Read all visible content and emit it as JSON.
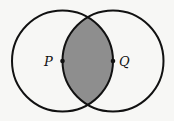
{
  "diagram": {
    "type": "two-circle intersection (vesica piscis)",
    "background_color": "#f7f7f5",
    "stroke_color": "#111111",
    "shaded_region_color": "#8e8e8e",
    "circles": [
      {
        "name": "left-circle",
        "cx": 62.5,
        "cy": 61,
        "r": 50.5
      },
      {
        "name": "right-circle",
        "cx": 113,
        "cy": 61,
        "r": 50.5
      }
    ],
    "shaded_region": "intersection of the two circles",
    "points": [
      {
        "label": "P",
        "x": 62.5,
        "y": 61,
        "label_x": 43,
        "label_y": 66
      },
      {
        "label": "Q",
        "x": 113,
        "y": 61,
        "label_x": 119,
        "label_y": 66
      }
    ]
  }
}
